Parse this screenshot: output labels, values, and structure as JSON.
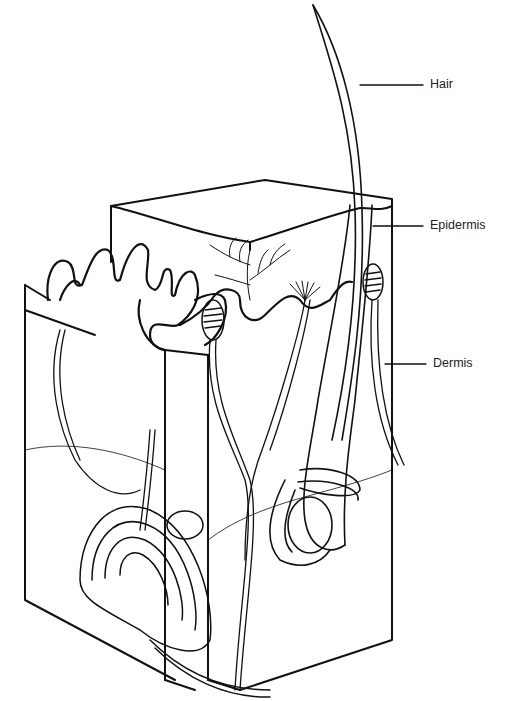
{
  "diagram": {
    "type": "anatomical-illustration",
    "labels": [
      {
        "id": "hair",
        "text": "Hair"
      },
      {
        "id": "epidermis",
        "text": "Epidermis"
      },
      {
        "id": "dermis",
        "text": "Dermis"
      }
    ]
  }
}
